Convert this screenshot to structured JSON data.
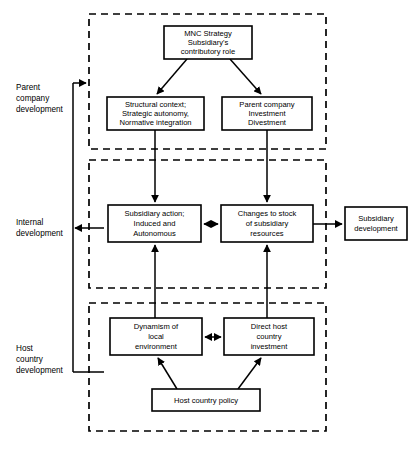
{
  "diagram": {
    "colors": {
      "background": "#ffffff",
      "stroke": "#000000",
      "node_fill": "#ffffff"
    },
    "zones": [
      {
        "id": "parent-company-development",
        "label_lines": [
          "Parent",
          "company",
          "development"
        ],
        "x": 89,
        "y": 14,
        "w": 237,
        "h": 135
      },
      {
        "id": "internal-development",
        "label_lines": [
          "Internal",
          "development"
        ],
        "x": 89,
        "y": 160,
        "w": 237,
        "h": 128
      },
      {
        "id": "host-country-development",
        "label_lines": [
          "Host",
          "country",
          "development"
        ],
        "x": 89,
        "y": 303,
        "w": 237,
        "h": 128
      }
    ],
    "nodes": [
      {
        "id": "mnc-strategy",
        "lines": [
          "MNC Strategy",
          "Subsidiary's",
          "contributory role"
        ],
        "x": 164,
        "y": 26,
        "w": 88,
        "h": 33
      },
      {
        "id": "structural-context",
        "lines": [
          "Structural context;",
          "Strategic autonomy,",
          "Normative integration"
        ],
        "x": 107,
        "y": 97,
        "w": 97,
        "h": 33
      },
      {
        "id": "parent-company-investment",
        "lines": [
          "Parent company",
          "Investment",
          "Divestment"
        ],
        "x": 222,
        "y": 97,
        "w": 90,
        "h": 33
      },
      {
        "id": "subsidiary-action",
        "lines": [
          "Subsidiary action;",
          "Induced and",
          "Autonomous"
        ],
        "x": 108,
        "y": 205,
        "w": 93,
        "h": 37
      },
      {
        "id": "changes-to-stock",
        "lines": [
          "Changes to stock",
          "of subsidiary",
          "resources"
        ],
        "x": 221,
        "y": 205,
        "w": 92,
        "h": 37
      },
      {
        "id": "subsidiary-development",
        "lines": [
          "Subsidiary",
          "development"
        ],
        "x": 345,
        "y": 207,
        "w": 62,
        "h": 33
      },
      {
        "id": "dynamism-local",
        "lines": [
          "Dynamism of",
          "local",
          "environment"
        ],
        "x": 110,
        "y": 318,
        "w": 92,
        "h": 37
      },
      {
        "id": "direct-host-investment",
        "lines": [
          "Direct host",
          "country",
          "investment"
        ],
        "x": 224,
        "y": 318,
        "w": 90,
        "h": 37
      },
      {
        "id": "host-country-policy",
        "lines": [
          "Host country policy"
        ],
        "x": 152,
        "y": 389,
        "w": 108,
        "h": 22
      }
    ],
    "edges": [
      {
        "id": "mnc-to-structural",
        "from": "mnc-strategy",
        "to": "structural-context",
        "style": "single-arrow"
      },
      {
        "id": "mnc-to-parent-investment",
        "from": "mnc-strategy",
        "to": "parent-company-investment",
        "style": "single-arrow"
      },
      {
        "id": "structural-to-subsidiary-action",
        "from": "structural-context",
        "to": "subsidiary-action",
        "style": "single-arrow"
      },
      {
        "id": "parent-investment-to-changes",
        "from": "parent-company-investment",
        "to": "changes-to-stock",
        "style": "single-arrow"
      },
      {
        "id": "subsidiary-action-changes",
        "from": "subsidiary-action",
        "to": "changes-to-stock",
        "style": "double-arrow"
      },
      {
        "id": "changes-to-subsidiary-development",
        "from": "changes-to-stock",
        "to": "subsidiary-development",
        "style": "single-arrow"
      },
      {
        "id": "dynamism-to-subsidiary-action",
        "from": "dynamism-local",
        "to": "subsidiary-action",
        "style": "single-arrow"
      },
      {
        "id": "direct-investment-to-changes",
        "from": "direct-host-investment",
        "to": "changes-to-stock",
        "style": "single-arrow"
      },
      {
        "id": "dynamism-direct-investment",
        "from": "dynamism-local",
        "to": "direct-host-investment",
        "style": "double-arrow"
      },
      {
        "id": "policy-to-dynamism",
        "from": "host-country-policy",
        "to": "dynamism-local",
        "style": "single-arrow"
      },
      {
        "id": "policy-to-direct-investment",
        "from": "host-country-policy",
        "to": "direct-host-investment",
        "style": "single-arrow"
      },
      {
        "id": "feedback-bus-to-parent-zone",
        "from": "feedback-bus",
        "to": "parent-company-development",
        "style": "single-arrow"
      },
      {
        "id": "feedback-internal-to-bus",
        "from": "internal-development",
        "to": "feedback-bus",
        "style": "single-arrow"
      },
      {
        "id": "feedback-host-to-bus",
        "from": "host-country-development",
        "to": "feedback-bus",
        "style": "plain"
      }
    ]
  }
}
